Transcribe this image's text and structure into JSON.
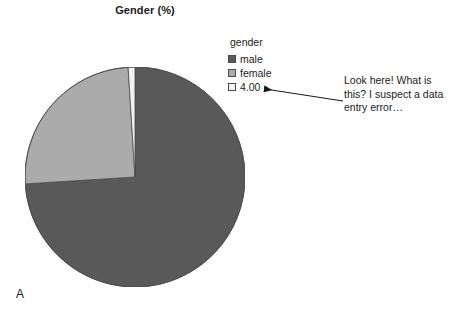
{
  "chart_data": {
    "type": "pie",
    "title": "Gender (%)",
    "categories": [
      "male",
      "female",
      "4.00"
    ],
    "values": [
      74.0,
      25.0,
      1.0
    ],
    "colors": [
      "#595959",
      "#ababab",
      "#f2f2f2"
    ],
    "legend_title": "gender",
    "legend_position": "right",
    "start_angle_deg": 0,
    "direction": "clockwise",
    "xlabel": "",
    "ylabel": "",
    "grid": false,
    "annotations": [
      {
        "text": "Look here! What is this? I suspect a data entry error…",
        "points_at": "4.00"
      }
    ]
  },
  "title": "Gender (%)",
  "legend": {
    "title": "gender",
    "items": [
      {
        "label": "male",
        "color": "#595959"
      },
      {
        "label": "female",
        "color": "#ababab"
      },
      {
        "label": "4.00",
        "color": "#f2f2f2"
      }
    ]
  },
  "annotation": {
    "line1": "Look here! What is",
    "line2": "this? I suspect a data",
    "line3": "entry error…"
  },
  "panel": {
    "label": "A"
  }
}
